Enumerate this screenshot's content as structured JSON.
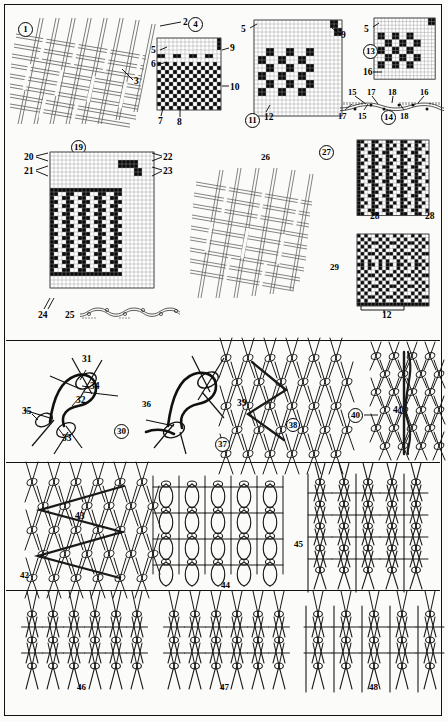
{
  "sheet": {
    "title": "Textile structure figure sheet",
    "background_color": "#fbfbfa",
    "ink_color": "#000000",
    "width": 448,
    "height": 722,
    "section_divider_y": [
      340,
      462,
      590
    ]
  },
  "figures": [
    {
      "id": "1",
      "number": "1",
      "circled": true,
      "x": 18,
      "y": 22,
      "kind": "woven-fabric-perspective",
      "callouts": [
        {
          "text": "2",
          "x": 183,
          "y": 18
        },
        {
          "text": "3",
          "x": 134,
          "y": 77
        }
      ]
    },
    {
      "id": "4",
      "number": "4",
      "circled": true,
      "x": 188,
      "y": 17,
      "kind": "weave-grid",
      "callouts": [
        {
          "text": "5",
          "x": 151,
          "y": 49
        },
        {
          "text": "6",
          "x": 151,
          "y": 63
        },
        {
          "text": "7",
          "x": 158,
          "y": 119
        },
        {
          "text": "8",
          "x": 177,
          "y": 120
        },
        {
          "text": "9",
          "x": 230,
          "y": 47
        },
        {
          "text": "10",
          "x": 230,
          "y": 85
        }
      ]
    },
    {
      "id": "11",
      "number": "11",
      "circled": true,
      "x": 245,
      "y": 113,
      "kind": "weave-grid",
      "callouts": [
        {
          "text": "5",
          "x": 241,
          "y": 27
        },
        {
          "text": "9",
          "x": 340,
          "y": 33
        },
        {
          "text": "12",
          "x": 264,
          "y": 115
        }
      ]
    },
    {
      "id": "13",
      "number": "13",
      "circled": true,
      "x": 363,
      "y": 44,
      "kind": "weave-grid",
      "callouts": [
        {
          "text": "5",
          "x": 364,
          "y": 27
        },
        {
          "text": "16",
          "x": 363,
          "y": 70
        },
        {
          "text": "15",
          "x": 349,
          "y": 90
        },
        {
          "text": "17",
          "x": 368,
          "y": 89
        },
        {
          "text": "18",
          "x": 389,
          "y": 89
        },
        {
          "text": "16",
          "x": 420,
          "y": 89
        }
      ]
    },
    {
      "id": "14",
      "number": "14",
      "circled": true,
      "x": 381,
      "y": 113,
      "kind": "cross-section-weave",
      "callouts": [
        {
          "text": "17",
          "x": 341,
          "y": 114
        },
        {
          "text": "15",
          "x": 360,
          "y": 114
        },
        {
          "text": "18",
          "x": 401,
          "y": 114
        }
      ]
    },
    {
      "id": "19",
      "number": "19",
      "circled": true,
      "x": 71,
      "y": 140,
      "kind": "weave-grid-large",
      "callouts": [
        {
          "text": "20",
          "x": 24,
          "y": 156
        },
        {
          "text": "21",
          "x": 24,
          "y": 170
        },
        {
          "text": "22",
          "x": 163,
          "y": 156
        },
        {
          "text": "23",
          "x": 163,
          "y": 170
        },
        {
          "text": "24",
          "x": 38,
          "y": 313
        },
        {
          "text": "25",
          "x": 65,
          "y": 313
        }
      ]
    },
    {
      "id": "26",
      "number": "26",
      "circled": false,
      "x": 258,
      "y": 152,
      "kind": "woven-fabric-perspective",
      "callouts": []
    },
    {
      "id": "27",
      "number": "27",
      "circled": true,
      "x": 319,
      "y": 145,
      "kind": "weave-grid",
      "callouts": [
        {
          "text": "28",
          "x": 370,
          "y": 213
        },
        {
          "text": "28",
          "x": 425,
          "y": 213
        }
      ]
    },
    {
      "id": "29",
      "number": "29",
      "circled": false,
      "x": 327,
      "y": 260,
      "kind": "weave-grid",
      "callouts": [
        {
          "text": "12",
          "x": 382,
          "y": 313
        }
      ]
    },
    {
      "id": "30",
      "number": "30",
      "circled": true,
      "x": 114,
      "y": 424,
      "kind": "knit-loop-single",
      "callouts": [
        {
          "text": "31",
          "x": 82,
          "y": 358
        },
        {
          "text": "34",
          "x": 90,
          "y": 385
        },
        {
          "text": "32",
          "x": 76,
          "y": 399
        },
        {
          "text": "33",
          "x": 62,
          "y": 437
        },
        {
          "text": "35",
          "x": 22,
          "y": 410
        }
      ]
    },
    {
      "id": "36",
      "number": "36",
      "circled": false,
      "x": 139,
      "y": 397,
      "kind": "knit-loop-single",
      "callouts": []
    },
    {
      "id": "37",
      "number": "37",
      "circled": true,
      "x": 215,
      "y": 437,
      "kind": "knit-mesh-diagonal",
      "callouts": [
        {
          "text": "39",
          "x": 237,
          "y": 402
        },
        {
          "text": "38",
          "x": 289,
          "y": 423
        }
      ]
    },
    {
      "id": "40",
      "number": "40",
      "circled": true,
      "x": 348,
      "y": 408,
      "kind": "knit-mesh-vertical",
      "callouts": [
        {
          "text": "41",
          "x": 393,
          "y": 409
        }
      ]
    },
    {
      "id": "42",
      "number": "42",
      "circled": false,
      "x": 17,
      "y": 568,
      "kind": "knit-mesh-zigzag",
      "callouts": [
        {
          "text": "43",
          "x": 75,
          "y": 515
        }
      ]
    },
    {
      "id": "44",
      "number": "44",
      "circled": false,
      "x": 218,
      "y": 578,
      "kind": "knit-mesh-tuck",
      "callouts": []
    },
    {
      "id": "45",
      "number": "45",
      "circled": false,
      "x": 291,
      "y": 539,
      "kind": "knit-mesh-rib",
      "callouts": []
    },
    {
      "id": "46",
      "number": "46",
      "circled": false,
      "x": 74,
      "y": 680,
      "kind": "knit-mesh-open",
      "callouts": []
    },
    {
      "id": "47",
      "number": "47",
      "circled": false,
      "x": 217,
      "y": 680,
      "kind": "knit-mesh-open",
      "callouts": []
    },
    {
      "id": "48",
      "number": "48",
      "circled": false,
      "x": 366,
      "y": 680,
      "kind": "knit-mesh-ladder",
      "callouts": []
    }
  ],
  "chart_data": {
    "type": "heatmap",
    "note": "Each grid is a binary weave draft. 1 = black filled square, 0 = empty white square.",
    "grids": [
      {
        "figure": "4",
        "cols": 16,
        "rows": 18,
        "cell_px": 4.0,
        "x": 157,
        "y": 38,
        "rows_data": [
          "0000000000000001",
          "0000000000000001",
          "0000000000000001",
          "0000000000000000",
          "1100110011001100",
          "0000000000000000",
          "1010101010101010",
          "0101010101010101",
          "1010101010101010",
          "0101010101010101",
          "1010101010101010",
          "0101010101010101",
          "1010101010101010",
          "0101010101010101",
          "1010101010101010",
          "0101010101010101",
          "1010101010101010",
          "0101010101010101"
        ]
      },
      {
        "figure": "11",
        "cols": 22,
        "rows": 24,
        "cell_px": 4.0,
        "x": 254,
        "y": 20,
        "rows_data": [
          "0000000000000000000110",
          "0000000000000000000110",
          "0000000000000000000011",
          "0000000000000000000011",
          "0000000000000000000000",
          "0000000000000000000000",
          "0000000000000000000000",
          "0001100011000110000000",
          "0001100011000110000000",
          "0110001100011000000000",
          "0110001100011000000000",
          "0001100011000110000000",
          "0001100011000110000000",
          "0110001100011000000000",
          "0110001100011000000000",
          "0001100011000110000000",
          "0001100011000110000000",
          "0110001100011000000000",
          "0110001100011000000000",
          "0000000000000000000000",
          "0000000000000000000000",
          "0000000000000000000000",
          "0000000000000000000000",
          "0000000000000000000000"
        ]
      },
      {
        "figure": "13",
        "cols": 17,
        "rows": 17,
        "cell_px": 3.6,
        "x": 374,
        "y": 18,
        "rows_data": [
          "00000000000000011",
          "00000000000000011",
          "00000000000000000",
          "00000000000000000",
          "01100110011000000",
          "01100110011000000",
          "00011001100110000",
          "00011001100110000",
          "01100110011000000",
          "01100110011000000",
          "00011001100110000",
          "00011001100110000",
          "01100110011000000",
          "01100110011000000",
          "00000000000000000",
          "00000000000000000",
          "00000000000000000"
        ]
      },
      {
        "figure": "19",
        "cols": 26,
        "rows": 34,
        "cell_px": 4.0,
        "x": 50,
        "y": 152,
        "rows_data": [
          "00000000000000000000000000",
          "00000000000000000000000000",
          "00000000000000000111110000",
          "00000000000000000111110000",
          "00000000000000000000011000",
          "00000000000000000000011000",
          "00000000000000000000000000",
          "00000000000000000000000000",
          "00000000000000000000000000",
          "11111111111111111100000000",
          "11001100110011001100000000",
          "10011001100110011000000000",
          "11001100110011001100000000",
          "10011001100110011000000000",
          "11001100110011001100000000",
          "10011001100110011000000000",
          "11001100110011001100000000",
          "10011001100110011000000000",
          "11001100110011001100000000",
          "10011001100110011000000000",
          "11001100110011001100000000",
          "10011001100110011000000000",
          "11001100110011001100000000",
          "10011001100110011000000000",
          "11001100110011001100000000",
          "10011001100110011000000000",
          "11001100110011001100000000",
          "10011001100110011000000000",
          "11001100110011001100000000",
          "10011001100110011000000000",
          "11111111111111111100000000",
          "00000000000000000000000000",
          "00000000000000000000000000",
          "00000000000000000000000000"
        ]
      },
      {
        "figure": "27",
        "cols": 20,
        "rows": 21,
        "cell_px": 3.6,
        "x": 357,
        "y": 140,
        "rows_data": [
          "11001100110011001100",
          "10101010101010101010",
          "11001100110011001100",
          "10011001100110011001",
          "11001100110011001100",
          "10101010101010101010",
          "11001100110011001100",
          "10011001100110011001",
          "11001100110011001100",
          "10101010101010101010",
          "11001100110011001100",
          "10011001100110011001",
          "11001100110011001100",
          "10101010101010101010",
          "11001100110011001100",
          "10011001100110011001",
          "11001100110011001100",
          "10101010101010101010",
          "11001100110011001100",
          "10011001100110011001",
          "11001100110011001100"
        ]
      },
      {
        "figure": "29",
        "cols": 20,
        "rows": 20,
        "cell_px": 3.6,
        "x": 357,
        "y": 234,
        "rows_data": [
          "10100101001010010100",
          "01010010100101001010",
          "10101101011010110101",
          "01010010100101001010",
          "10100101001010010100",
          "01011010110101101011",
          "10100101001010010100",
          "01010010100101001010",
          "11011010110110101101",
          "01010010100101001010",
          "10100101001010010100",
          "01011010110101101011",
          "10100101001010010100",
          "01010010100101001010",
          "10101101011010110101",
          "01010010100101001010",
          "10100101001010010100",
          "01011010110101101011",
          "10100101001010010100",
          "11111111111111111111"
        ]
      }
    ]
  }
}
